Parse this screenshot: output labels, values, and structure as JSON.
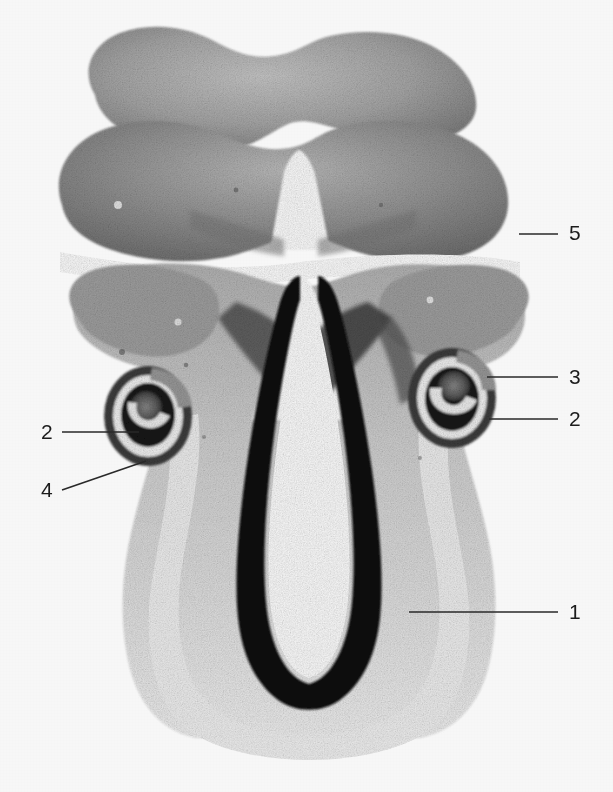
{
  "figure": {
    "kind": "histological-micrograph",
    "background_color": "#ffffff",
    "tissue_mid_gray": "#9a9a9a",
    "tissue_dark_gray": "#6e6e6e",
    "tissue_light_gray": "#cfcfcf",
    "outline_black": "#151515",
    "label_color": "#1c1c1c",
    "leader_color": "#2a2a2a",
    "width": 613,
    "height": 792
  },
  "labels": [
    {
      "id": "label-5",
      "text": "5",
      "text_x": 569,
      "text_y": 222,
      "leader": {
        "x1": 519,
        "y1": 234,
        "x2": 558,
        "y2": 234
      },
      "side": "right"
    },
    {
      "id": "label-3",
      "text": "3",
      "text_x": 569,
      "text_y": 366,
      "leader": {
        "x1": 487,
        "y1": 377,
        "x2": 558,
        "y2": 377
      },
      "side": "right"
    },
    {
      "id": "label-2-right",
      "text": "2",
      "text_x": 569,
      "text_y": 408,
      "leader": {
        "x1": 489,
        "y1": 419,
        "x2": 558,
        "y2": 419
      },
      "side": "right"
    },
    {
      "id": "label-2-left",
      "text": "2",
      "text_x": 41,
      "text_y": 421,
      "leader": {
        "x1": 62,
        "y1": 432,
        "x2": 139,
        "y2": 432
      },
      "side": "left"
    },
    {
      "id": "label-4",
      "text": "4",
      "text_x": 41,
      "text_y": 479,
      "leader": {
        "x1": 62,
        "y1": 490,
        "x2": 142,
        "y2": 462
      },
      "side": "left"
    },
    {
      "id": "label-1",
      "text": "1",
      "text_x": 569,
      "text_y": 601,
      "leader": {
        "x1": 409,
        "y1": 612,
        "x2": 558,
        "y2": 612
      },
      "side": "right"
    }
  ]
}
